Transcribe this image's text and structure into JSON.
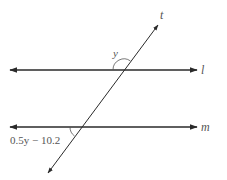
{
  "diagram": {
    "type": "parallel-lines-transversal",
    "lines": [
      {
        "name": "l",
        "label": "l",
        "direction": "horizontal"
      },
      {
        "name": "m",
        "label": "m",
        "direction": "horizontal"
      },
      {
        "name": "t",
        "label": "t",
        "direction": "transversal"
      }
    ],
    "angles": [
      {
        "label": "y",
        "position": "above line l, left of transversal t"
      },
      {
        "label": "0.5y − 10.2",
        "position": "below line m, left of transversal t"
      }
    ],
    "colors": {
      "line": "#2a2a2a",
      "label": "#555555",
      "background": "#ffffff"
    }
  }
}
